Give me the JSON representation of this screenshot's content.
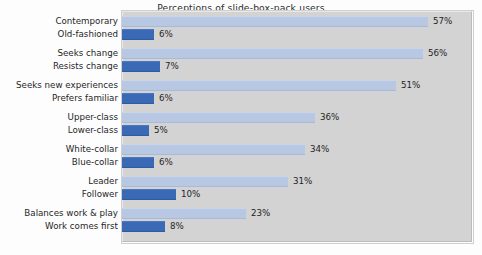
{
  "chart_data": {
    "type": "bar",
    "orientation": "horizontal",
    "title": "Perceptions of slide-box-pack users",
    "xlabel": "",
    "ylabel": "",
    "xlim": [
      0,
      65
    ],
    "grid": false,
    "legend": "none",
    "value_suffix": "%",
    "colors": {
      "positive_bar": "#b8c8e3",
      "negative_bar": "#3a69b5",
      "plot_background": "#d3d3d3",
      "page_background": "#fdfdfd",
      "text": "#1f1f1f"
    },
    "groups": [
      {
        "name": "modernity",
        "pairs": [
          {
            "category": "Contemporary",
            "value": 57,
            "label": "57%",
            "style": "light"
          },
          {
            "category": "Old-fashioned",
            "value": 6,
            "label": "6%",
            "style": "dark"
          }
        ]
      },
      {
        "name": "change",
        "pairs": [
          {
            "category": "Seeks change",
            "value": 56,
            "label": "56%",
            "style": "light"
          },
          {
            "category": "Resists change",
            "value": 7,
            "label": "7%",
            "style": "dark"
          }
        ]
      },
      {
        "name": "experience",
        "pairs": [
          {
            "category": "Seeks new experiences",
            "value": 51,
            "label": "51%",
            "style": "light"
          },
          {
            "category": "Prefers familiar",
            "value": 6,
            "label": "6%",
            "style": "dark"
          }
        ]
      },
      {
        "name": "class",
        "pairs": [
          {
            "category": "Upper-class",
            "value": 36,
            "label": "36%",
            "style": "light"
          },
          {
            "category": "Lower-class",
            "value": 5,
            "label": "5%",
            "style": "dark"
          }
        ]
      },
      {
        "name": "collar",
        "pairs": [
          {
            "category": "White-collar",
            "value": 34,
            "label": "34%",
            "style": "light"
          },
          {
            "category": "Blue-collar",
            "value": 6,
            "label": "6%",
            "style": "dark"
          }
        ]
      },
      {
        "name": "leadership",
        "pairs": [
          {
            "category": "Leader",
            "value": 31,
            "label": "31%",
            "style": "light"
          },
          {
            "category": "Follower",
            "value": 10,
            "label": "10%",
            "style": "dark"
          }
        ]
      },
      {
        "name": "work-life",
        "pairs": [
          {
            "category": "Balances work & play",
            "value": 23,
            "label": "23%",
            "style": "light"
          },
          {
            "category": "Work comes first",
            "value": 8,
            "label": "8%",
            "style": "dark"
          }
        ]
      }
    ]
  }
}
